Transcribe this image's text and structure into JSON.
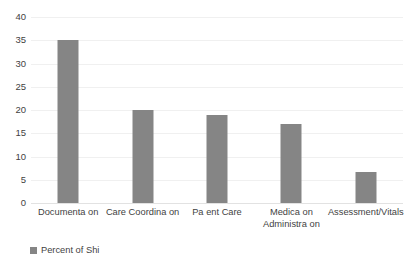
{
  "chart_data": {
    "type": "bar",
    "title": "",
    "subtitle": "",
    "xlabel": "",
    "ylabel": "",
    "ylim": [
      0,
      40
    ],
    "ytick_step": 5,
    "yticks": [
      40,
      35,
      30,
      25,
      20,
      15,
      10,
      5,
      0
    ],
    "ytick_labels": [
      "40",
      "35",
      "30",
      "25",
      "20",
      "15",
      "10",
      "5",
      "0"
    ],
    "grid": true,
    "grid_axis": "y",
    "legend_position": "bottom-left",
    "categories": [
      "Documenta on",
      "Care Coordina on",
      "Pa ent Care",
      "Medica on\nAdministra on",
      "Assessment/Vitals"
    ],
    "series": [
      {
        "name": "Percent of Shi",
        "color": "#858585",
        "values": [
          35,
          20,
          19,
          17,
          6.7
        ]
      }
    ]
  },
  "legend": {
    "entries": [
      {
        "label": "Percent of Shi",
        "color": "#858585"
      }
    ]
  },
  "colors": {
    "bar": "#858585",
    "gridline": "#f0f0f0",
    "baseline": "#e2e2e2",
    "text": "#3f3f3f",
    "background": "#ffffff"
  }
}
